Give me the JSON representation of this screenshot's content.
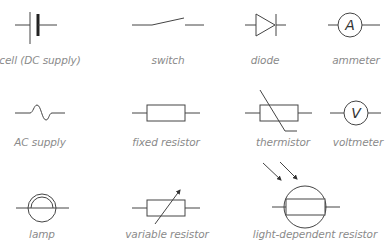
{
  "diagram": {
    "stroke_color": "#444444",
    "label_color": "#8a8a8a",
    "symbols": [
      {
        "id": "cell",
        "label": "cell (DC supply)"
      },
      {
        "id": "switch",
        "label": "switch"
      },
      {
        "id": "diode",
        "label": "diode"
      },
      {
        "id": "ammeter",
        "label": "ammeter",
        "letter": "A"
      },
      {
        "id": "ac-supply",
        "label": "AC supply"
      },
      {
        "id": "fixed-resistor",
        "label": "fixed resistor"
      },
      {
        "id": "thermistor",
        "label": "thermistor"
      },
      {
        "id": "voltmeter",
        "label": "voltmeter",
        "letter": "V"
      },
      {
        "id": "lamp",
        "label": "lamp"
      },
      {
        "id": "variable-resistor",
        "label": "variable resistor"
      },
      {
        "id": "ldr",
        "label": "light-dependent resistor"
      }
    ]
  }
}
